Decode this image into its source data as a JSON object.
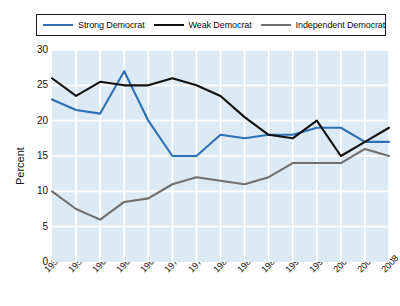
{
  "chart_data": {
    "type": "line",
    "title": "",
    "xlabel": "",
    "ylabel": "Percent",
    "ylim": [
      0,
      30
    ],
    "yticks": [
      0,
      5,
      10,
      15,
      20,
      25,
      30
    ],
    "grid": true,
    "legend_position": "top",
    "categories": [
      "1952",
      "1956",
      "1960",
      "1964",
      "1968",
      "1972",
      "1976",
      "1980",
      "1984",
      "1988",
      "1992",
      "1996",
      "2000",
      "2004",
      "2008"
    ],
    "series": [
      {
        "name": "Strong Democrat",
        "color": "#2f6fb5",
        "values": [
          23.0,
          21.5,
          21.0,
          27.0,
          20.0,
          15.0,
          15.0,
          18.0,
          17.5,
          18.0,
          18.0,
          19.0,
          19.0,
          17.0,
          17.0
        ]
      },
      {
        "name": "Weak Democrat",
        "color": "#111111",
        "values": [
          26.0,
          23.5,
          25.5,
          25.0,
          25.0,
          26.0,
          25.0,
          23.5,
          20.5,
          18.0,
          17.5,
          20.0,
          15.0,
          17.0,
          19.0
        ]
      },
      {
        "name": "Independent Democrat",
        "color": "#6f6f6f",
        "values": [
          10.0,
          7.5,
          6.0,
          8.5,
          9.0,
          11.0,
          12.0,
          11.5,
          11.0,
          12.0,
          14.0,
          14.0,
          14.0,
          16.0,
          15.0
        ]
      }
    ]
  },
  "legend": {
    "entries": [
      {
        "label": "Strong Democrat"
      },
      {
        "label": "Weak Democrat"
      },
      {
        "label": "Independent Democrat"
      }
    ]
  },
  "axes": {
    "y_title": "Percent"
  },
  "colors": {
    "plot_background": "#dbeaf4",
    "gridline": "#ffffff",
    "axis_text": "#111111",
    "legend_border": "#1a1a1a"
  }
}
